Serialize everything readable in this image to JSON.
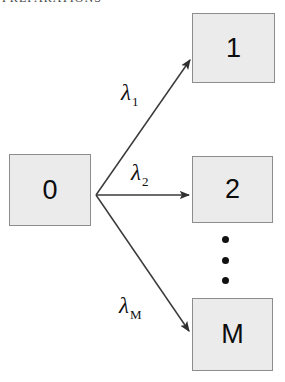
{
  "header": {
    "running_head": "PREPARATIONS"
  },
  "diagram": {
    "source_node": {
      "id": "node-0",
      "label": "0"
    },
    "target_nodes": [
      {
        "id": "node-1",
        "label": "1"
      },
      {
        "id": "node-2",
        "label": "2"
      },
      {
        "id": "node-m",
        "label": "M"
      }
    ],
    "edges": [
      {
        "id": "edge-0-1",
        "from": "0",
        "to": "1",
        "rate_symbol": "λ",
        "rate_subscript": "1"
      },
      {
        "id": "edge-0-2",
        "from": "0",
        "to": "2",
        "rate_symbol": "λ",
        "rate_subscript": "2"
      },
      {
        "id": "edge-0-m",
        "from": "0",
        "to": "M",
        "rate_symbol": "λ",
        "rate_subscript": "M"
      }
    ],
    "ellipsis": {
      "name": "vertical-ellipsis",
      "dots": 3
    },
    "colors": {
      "box_fill": "#ebebeb",
      "box_border": "#8d8d8d",
      "text": "#0d0d0d",
      "arrow": "#3a3a3a",
      "background": "#ffffff"
    }
  }
}
